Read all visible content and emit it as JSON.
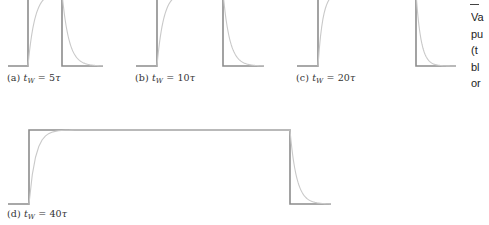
{
  "figure": {
    "panels": [
      {
        "id": "a",
        "label_prefix": "(a) ",
        "t_symbol": "t",
        "subscript": "W",
        "equals": " = ",
        "value": "5",
        "tau": "τ",
        "pulse_width_tau": 5,
        "geometry": {
          "x_start": 8,
          "x_rise": 28,
          "x_fall": 62,
          "x_end": 103,
          "y_base": 66,
          "y_top": -8
        },
        "label_pos": {
          "x": 7,
          "y": 72
        }
      },
      {
        "id": "b",
        "label_prefix": "(b) ",
        "t_symbol": "t",
        "subscript": "W",
        "equals": " = ",
        "value": "10",
        "tau": "τ",
        "pulse_width_tau": 10,
        "geometry": {
          "x_start": 136,
          "x_rise": 157,
          "x_fall": 223,
          "x_end": 264,
          "y_base": 66,
          "y_top": -8
        },
        "label_pos": {
          "x": 135,
          "y": 72
        }
      },
      {
        "id": "c",
        "label_prefix": "(c) ",
        "t_symbol": "t",
        "subscript": "W",
        "equals": " = ",
        "value": "20",
        "tau": "τ",
        "pulse_width_tau": 20,
        "geometry": {
          "x_start": 297,
          "x_rise": 318,
          "x_fall": 416,
          "x_end": 456,
          "y_base": 66,
          "y_top": -8
        },
        "label_pos": {
          "x": 296,
          "y": 72
        }
      },
      {
        "id": "d",
        "label_prefix": "(d) ",
        "t_symbol": "t",
        "subscript": "W",
        "equals": " = ",
        "value": "40",
        "tau": "τ",
        "pulse_width_tau": 40,
        "geometry": {
          "x_start": 8,
          "x_rise": 29,
          "x_fall": 290,
          "x_end": 331,
          "y_base": 204,
          "y_top": 130
        },
        "label_pos": {
          "x": 7,
          "y": 208
        }
      }
    ],
    "colors": {
      "pulse": "#8c8c8c",
      "response": "#c9c9c9",
      "text": "#333333"
    }
  },
  "side_caption": {
    "lines": [
      "Va",
      "pu",
      "(t",
      "bl",
      "or"
    ]
  }
}
